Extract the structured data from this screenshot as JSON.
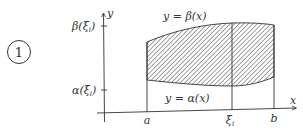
{
  "figure": {
    "number_label": "1",
    "axes": {
      "x_label": "x",
      "y_label": "y"
    },
    "x_ticks": [
      "a",
      "ξ",
      "b"
    ],
    "x_tick_subscript": "i",
    "y_ticks": {
      "upper": {
        "fn": "β(ξ",
        "sub": "i",
        "close": ")"
      },
      "lower": {
        "fn": "α(ξ",
        "sub": "i",
        "close": ")"
      }
    },
    "curves": {
      "upper": "y = β(x)",
      "lower": "y = α(x)"
    },
    "colors": {
      "line": "#333333",
      "hatch": "#444444",
      "background": "#ffffff"
    }
  }
}
